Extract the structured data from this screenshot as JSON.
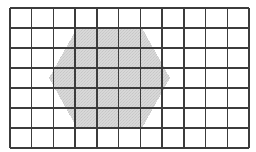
{
  "figure": {
    "canvas": {
      "width": 256,
      "height": 152,
      "background": "#ffffff"
    },
    "grid": {
      "columns": 11,
      "rows": 7,
      "x_start": 10,
      "y_start": 8,
      "cell_width": 21.73,
      "cell_height": 20,
      "line_color": "#3c3c3c",
      "line_width": 1.5,
      "x_lines": [
        10,
        31.7,
        53.5,
        75.2,
        96.9,
        118.6,
        140.4,
        162.1,
        183.8,
        205.5,
        227.3,
        249
      ],
      "y_lines": [
        8,
        28,
        48,
        68,
        88,
        108,
        128,
        148
      ]
    },
    "shape": {
      "type": "hexagon",
      "orientation": "flat-top",
      "fill_color": "#d6d6d6",
      "stroke_color": "none",
      "texture": "fine-stipple",
      "vertices": [
        {
          "x": 77,
          "y": 28
        },
        {
          "x": 142,
          "y": 28
        },
        {
          "x": 170,
          "y": 78
        },
        {
          "x": 142,
          "y": 128
        },
        {
          "x": 77,
          "y": 128
        },
        {
          "x": 49,
          "y": 78
        }
      ],
      "points_attr": "77,28 142,28 170,78 142,128 77,128 49,78",
      "width": 121,
      "height": 100,
      "center": {
        "x": 109.5,
        "y": 78
      }
    }
  }
}
